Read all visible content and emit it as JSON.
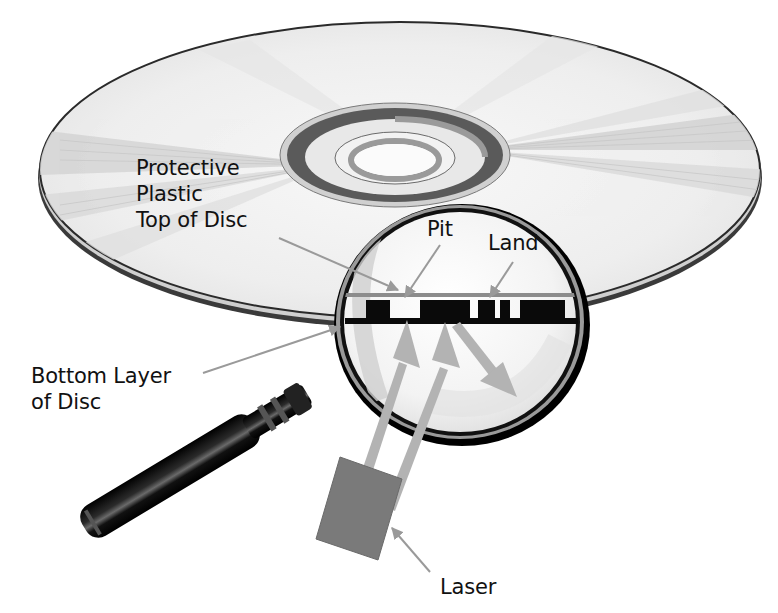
{
  "diagram": {
    "labels": {
      "protective_plastic": [
        "Protective",
        "Plastic",
        "Top of Disc"
      ],
      "pit": "Pit",
      "land": "Land",
      "bottom_layer": [
        "Bottom Layer",
        "of Disc"
      ],
      "laser": "Laser"
    },
    "colors": {
      "background": "#ffffff",
      "disc_face": "#eeeeee",
      "disc_streak": "#d2d2d2",
      "disc_edge": "#2a2a2a",
      "hub_ring": "#555555",
      "lens_fill": "#f4f4f4",
      "lens_rim": "#111111",
      "leader_line": "#9a9a9a",
      "laser_beam": "#b3b3b3",
      "laser_box": "#7a7a7a",
      "pit_blocks": "#0a0a0a",
      "handle": "#0d0d0d"
    },
    "nodes": [
      {
        "id": "disc",
        "kind": "compact-disc"
      },
      {
        "id": "magnifier",
        "kind": "magnifying-glass"
      },
      {
        "id": "cross-section",
        "kind": "pit-land-track"
      },
      {
        "id": "laser",
        "kind": "laser-emitter"
      }
    ],
    "edges": [
      {
        "from": "laser",
        "to": "pit",
        "kind": "incident-beam"
      },
      {
        "from": "laser",
        "to": "land",
        "kind": "incident-beam"
      },
      {
        "from": "land",
        "to": "outside",
        "kind": "reflected-beam"
      }
    ]
  }
}
